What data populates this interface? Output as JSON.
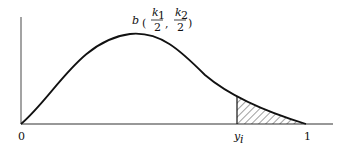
{
  "diagram": {
    "type": "beta-density-sketch",
    "curve_label": {
      "func": "b",
      "k1": "k",
      "k1_sub": "1",
      "k2": "k",
      "k2_sub": "2",
      "denom": "2"
    },
    "x_axis_labels": {
      "origin": "0",
      "yi": "y",
      "yi_sub": "i",
      "end": "1"
    },
    "shaded_region": "tail area from y_i to 1 (hatched)",
    "colors": {
      "ink": "#111111",
      "background": "#ffffff"
    }
  }
}
